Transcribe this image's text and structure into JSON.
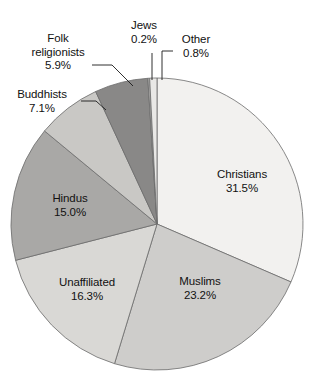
{
  "chart_data": {
    "type": "pie",
    "title": "",
    "xlabel": "",
    "ylabel": "",
    "unit": "%",
    "start_angle_deg": 0,
    "direction": "clockwise",
    "total": 100.0,
    "categories": [
      "Christians",
      "Muslims",
      "Unaffiliated",
      "Hindus",
      "Buddhists",
      "Folk religionists",
      "Jews",
      "Other"
    ],
    "values": [
      31.5,
      23.2,
      16.3,
      15.0,
      7.1,
      5.9,
      0.2,
      0.8
    ],
    "colors": [
      "#f2f1ef",
      "#cecdcb",
      "#d9d8d5",
      "#a9a8a6",
      "#c9c8c5",
      "#898887",
      "#b2b1af",
      "#e9e8e6"
    ],
    "label_placement": [
      "inside",
      "inside",
      "inside",
      "inside",
      "outside",
      "outside",
      "outside",
      "outside"
    ],
    "legend": "none",
    "grid": false
  },
  "slices": [
    {
      "name": "Christians",
      "value": "31.5%",
      "label": "Christians",
      "pct": 31.5
    },
    {
      "name": "Muslims",
      "value": "23.2%",
      "label": "Muslims",
      "pct": 23.2
    },
    {
      "name": "Unaffiliated",
      "value": "16.3%",
      "label": "Unaffiliated",
      "pct": 16.3
    },
    {
      "name": "Hindus",
      "value": "15.0%",
      "label": "Hindus",
      "pct": 15.0
    },
    {
      "name": "Buddhists",
      "value": "7.1%",
      "label": "Buddhists",
      "pct": 7.1
    },
    {
      "name": "Folk religionists",
      "value": "5.9%",
      "label": "Folk religionists",
      "pct": 5.9
    },
    {
      "name": "Jews",
      "value": "0.2%",
      "label": "Jews",
      "pct": 0.2
    },
    {
      "name": "Other",
      "value": "0.8%",
      "label": "Other",
      "pct": 0.8
    }
  ],
  "labels": {
    "christians_name": "Christians",
    "christians_value": "31.5%",
    "muslims_name": "Muslims",
    "muslims_value": "23.2%",
    "unaffiliated_name": "Unaffiliated",
    "unaffiliated_value": "16.3%",
    "hindus_name": "Hindus",
    "hindus_value": "15.0%",
    "buddhists_name": "Buddhists",
    "buddhists_value": "7.1%",
    "folk_name_line1": "Folk",
    "folk_name_line2": "religionists",
    "folk_value": "5.9%",
    "jews_name": "Jews",
    "jews_value": "0.2%",
    "other_name": "Other",
    "other_value": "0.8%"
  },
  "geometry": {
    "center_x": 157,
    "center_y": 224,
    "radius": 146
  }
}
